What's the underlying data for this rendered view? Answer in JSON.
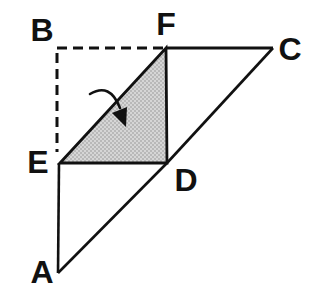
{
  "figure": {
    "vertex_labels": {
      "A": "A",
      "B": "B",
      "C": "C",
      "D": "D",
      "E": "E",
      "F": "F"
    },
    "colors": {
      "line": "#111111",
      "shaded_base": "#d6d6d6",
      "shaded_dot": "#8f8f8f",
      "background": "#ffffff"
    }
  }
}
